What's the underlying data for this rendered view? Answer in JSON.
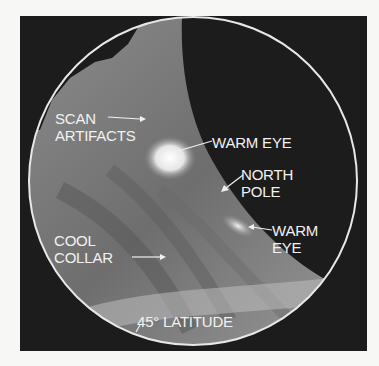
{
  "figure": {
    "colors": {
      "background": "#f7f7f5",
      "frame": "#1c1c1c",
      "limb_ring": "#e8e8e8",
      "label_text": "#f2f2f2"
    }
  },
  "labels": {
    "scan_artifacts": [
      "SCAN",
      "ARTIFACTS"
    ],
    "warm_eye_1": "WARM EYE",
    "north_pole": [
      "NORTH",
      "POLE"
    ],
    "warm_eye_2": [
      "WARM",
      "EYE"
    ],
    "cool_collar": [
      "COOL",
      "COLLAR"
    ],
    "latitude": "45° LATITUDE"
  }
}
